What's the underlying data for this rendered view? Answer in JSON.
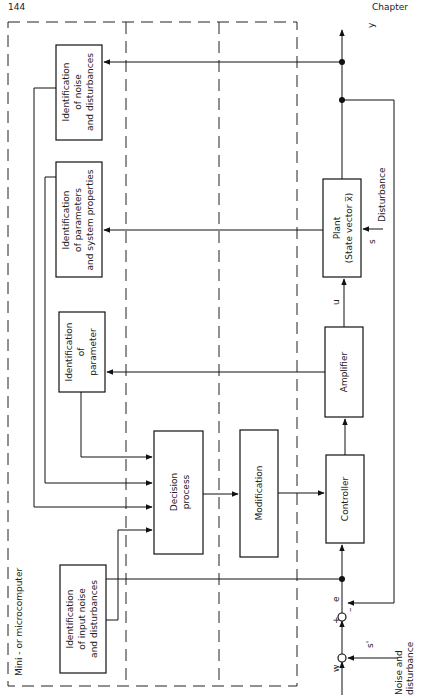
{
  "page": {
    "page_number": "144",
    "chapter_label": "Chapter"
  },
  "diagram": {
    "region_label": "Mini - or microcomputer",
    "blocks": {
      "id_noise": [
        "Identification",
        "of noise",
        "and disturbances"
      ],
      "id_params": [
        "Identification",
        "of parameters",
        "and system properties"
      ],
      "id_param": [
        "Identification",
        "of",
        "parameter"
      ],
      "id_input": [
        "Identification",
        "of input noise",
        "and disturbances"
      ],
      "decision": [
        "Decision",
        "process"
      ],
      "modification": [
        "Modification"
      ],
      "controller": [
        "Controller"
      ],
      "amplifier": [
        "Amplifier"
      ],
      "plant": [
        "Plant",
        "(State vector x̅)"
      ]
    },
    "signals": {
      "output": "y",
      "control": "u",
      "error": "e",
      "reference": "w",
      "disturbance_s": "s",
      "noise_s": "s'",
      "plus": "+",
      "minus": "–",
      "disturbance": "Disturbance",
      "noise_and_disturbance": [
        "Noise and",
        "disturbance"
      ]
    }
  }
}
